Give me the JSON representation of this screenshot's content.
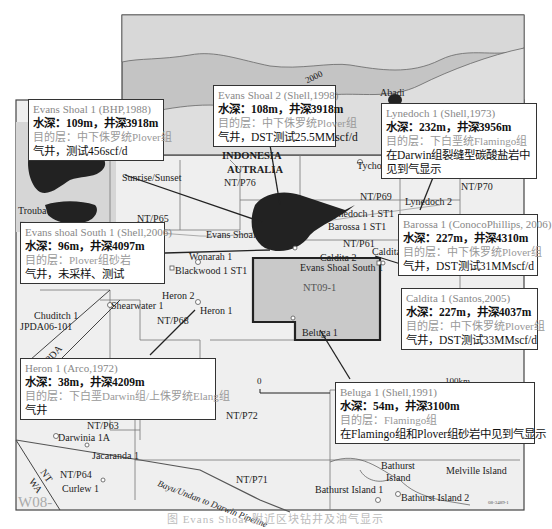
{
  "figure": {
    "watermark": "W08-",
    "figure_code": "08-3489-1",
    "caption": "图 Evans Shoal 附近区块钻井及油气显示",
    "contour_label": "2000",
    "country_labels": [
      "INDONESIA",
      "AUTRALIA"
    ],
    "scale_bar": {
      "start": "0",
      "end": "100km"
    },
    "pipeline_label": "Bayu/Undan to Darwin Pipeline",
    "boundary_labels": [
      "JPDA",
      "NT",
      "NT",
      "WA"
    ]
  },
  "blocks": [
    "NT/P76",
    "NT/P65",
    "NT/P69",
    "NT/P70",
    "NT/P61",
    "NT/P68",
    "NT09-1",
    "NT/P72",
    "NT/P63",
    "NT/P64",
    "NT/P71",
    "JPDA06-101"
  ],
  "fields": [
    "Sunrise/Sunset",
    "Troubadour",
    "Evans Shoal",
    "Abadi"
  ],
  "wells": [
    "Tycho",
    "Lynedoch 1 ST1",
    "Lynedoch 2",
    "Barossa 1 ST1",
    "Caldita 2",
    "Caldita",
    "Wonarah 1",
    "Blackwood 1 ST1",
    "Evans Shoal South 1",
    "Heron 2",
    "Heron 1",
    "Shearwater 1",
    "Chuditch 1",
    "Beluga 1",
    "Darwinia 1A",
    "Jacaranda 1",
    "Curlew 1",
    "Bathurst Island 1",
    "Bathurst Island 2"
  ],
  "islands": [
    "Bathurst",
    "Island",
    "Melville Island"
  ],
  "callouts": [
    {
      "title": "Evans Shoal 1 (BHP,1988)",
      "depth": "水深：109m，井深3918m",
      "target": "目的层：中下侏罗统Plover组",
      "result": "气井，测试456scf/d"
    },
    {
      "title": "Evans Shoal 2 (Shell,1998)",
      "depth": "水深：108m，井深3918m",
      "target": "目的层：中下侏罗统Plover组",
      "result": "气井，DST测试25.5MMscf/d"
    },
    {
      "title": "Lynedoch 1 (Shell,1973)",
      "depth": "水深：232m，井深3956m",
      "target": "目的层：下白垩统Flamingo组",
      "result": "在Darwin组裂缝型碳酸盐岩中见到气显示"
    },
    {
      "title": "Evans shoal South 1 (Shell,2006)",
      "depth": "水深：96m，井深4097m",
      "target": "目的层：Plover组砂岩",
      "result": "气井，未采样、测试"
    },
    {
      "title": "Barossa 1 (ConocoPhillips, 2006)",
      "depth": "水深：227m，井深4310m",
      "target": "目的层：中下侏罗统Plover组",
      "result": "气井，DST测试31MMscf/d"
    },
    {
      "title": "Caldita 1 (Santos,2005)",
      "depth": "水深：227m，井深4037m",
      "target": "目的层：中下侏罗统Plover组",
      "result": "气井，DST测试33MMscf/d"
    },
    {
      "title": "Heron 1 (Arco,1972)",
      "depth": "水深：38m，井深4209m",
      "target": "目的层：下白垩Darwin组/上侏罗统Elang组",
      "result": "气井"
    },
    {
      "title": "Beluga 1 (Shell,1991)",
      "depth": "水深：54m，井深3100m",
      "target": "目的层：Flamingo组",
      "result": "在Flamingo组和Plover组砂岩中见到气显示"
    }
  ],
  "colors": {
    "deep_sea": "#b9b9b9",
    "mid_sea": "#d2d2d2",
    "shelf": "#e9e9e9",
    "field": "#222222",
    "nt09_block": "#c8c8c8",
    "callout_border": "#333333"
  }
}
